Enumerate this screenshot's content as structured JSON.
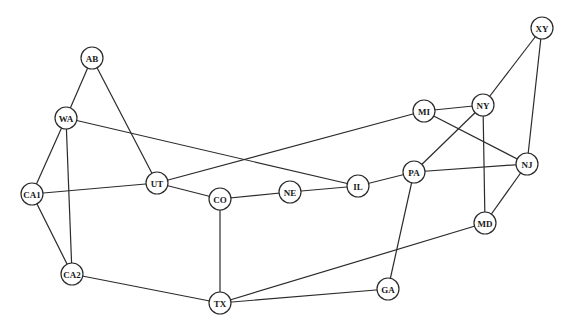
{
  "diagram": {
    "type": "undirected-graph",
    "node_radius": 11,
    "colors": {
      "stroke": "#2b2b2b",
      "fill": "#ffffff",
      "text": "#1a1a1a"
    },
    "nodes": [
      {
        "id": "AB",
        "label": "AB",
        "x": 92,
        "y": 58
      },
      {
        "id": "WA",
        "label": "WA",
        "x": 66,
        "y": 118
      },
      {
        "id": "CA1",
        "label": "CA1",
        "x": 32,
        "y": 194
      },
      {
        "id": "CA2",
        "label": "CA2",
        "x": 72,
        "y": 274
      },
      {
        "id": "UT",
        "label": "UT",
        "x": 157,
        "y": 183
      },
      {
        "id": "CO",
        "label": "CO",
        "x": 220,
        "y": 199
      },
      {
        "id": "NE",
        "label": "NE",
        "x": 290,
        "y": 192
      },
      {
        "id": "IL",
        "label": "IL",
        "x": 358,
        "y": 186
      },
      {
        "id": "PA",
        "label": "PA",
        "x": 414,
        "y": 172
      },
      {
        "id": "MI",
        "label": "MI",
        "x": 424,
        "y": 111
      },
      {
        "id": "NY",
        "label": "NY",
        "x": 483,
        "y": 105
      },
      {
        "id": "XY",
        "label": "XY",
        "x": 542,
        "y": 28
      },
      {
        "id": "NJ",
        "label": "NJ",
        "x": 527,
        "y": 164
      },
      {
        "id": "MD",
        "label": "MD",
        "x": 485,
        "y": 223
      },
      {
        "id": "TX",
        "label": "TX",
        "x": 220,
        "y": 303
      },
      {
        "id": "GA",
        "label": "GA",
        "x": 388,
        "y": 289
      }
    ],
    "edges": [
      [
        "AB",
        "WA"
      ],
      [
        "AB",
        "UT"
      ],
      [
        "WA",
        "CA1"
      ],
      [
        "WA",
        "CA2"
      ],
      [
        "WA",
        "IL"
      ],
      [
        "CA1",
        "UT"
      ],
      [
        "CA1",
        "CA2"
      ],
      [
        "CA2",
        "TX"
      ],
      [
        "UT",
        "CO"
      ],
      [
        "UT",
        "MI"
      ],
      [
        "CO",
        "NE"
      ],
      [
        "CO",
        "TX"
      ],
      [
        "NE",
        "IL"
      ],
      [
        "IL",
        "PA"
      ],
      [
        "PA",
        "NY"
      ],
      [
        "PA",
        "NJ"
      ],
      [
        "PA",
        "GA"
      ],
      [
        "MI",
        "NY"
      ],
      [
        "MI",
        "NJ"
      ],
      [
        "NY",
        "XY"
      ],
      [
        "NY",
        "MD"
      ],
      [
        "XY",
        "NJ"
      ],
      [
        "NJ",
        "MD"
      ],
      [
        "MD",
        "TX"
      ],
      [
        "TX",
        "GA"
      ]
    ]
  }
}
